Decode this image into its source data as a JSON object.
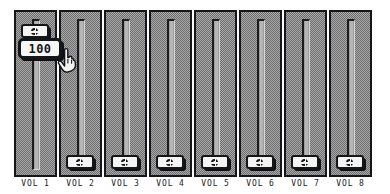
{
  "app": {
    "title": "Volume Mixer",
    "background_color": "#ffffff",
    "panel_color": "#8d8d8d",
    "border_color": "#15161a",
    "thumb_color": "#f4f4f2",
    "label_color": "#1a1b1f"
  },
  "tooltip": {
    "value": "100",
    "visible": true,
    "attached_to_channel": 1
  },
  "cursor": {
    "icon": "pointing-hand-cursor",
    "visible": true
  },
  "channels": [
    {
      "label": "VOL 1",
      "value": 100,
      "thumb_position": "top"
    },
    {
      "label": "VOL 2",
      "value": 0,
      "thumb_position": "bottom"
    },
    {
      "label": "VOL 3",
      "value": 0,
      "thumb_position": "bottom"
    },
    {
      "label": "VOL 4",
      "value": 0,
      "thumb_position": "bottom"
    },
    {
      "label": "VOL 5",
      "value": 0,
      "thumb_position": "bottom"
    },
    {
      "label": "VOL 6",
      "value": 0,
      "thumb_position": "bottom"
    },
    {
      "label": "VOL 7",
      "value": 0,
      "thumb_position": "bottom"
    },
    {
      "label": "VOL 8",
      "value": 0,
      "thumb_position": "bottom"
    }
  ],
  "layout": {
    "channel_count": 8,
    "first_channel_left": 14,
    "channel_pitch": 45,
    "channel_width": 43,
    "channel_top": 10,
    "channel_height": 167,
    "thumb_top_y": 12,
    "thumb_bottom_y": 143,
    "tooltip_left": 18,
    "tooltip_top": 38,
    "cursor_left": 56,
    "cursor_top": 47
  }
}
